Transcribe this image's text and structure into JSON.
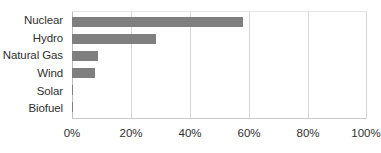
{
  "chart_data": {
    "type": "bar",
    "orientation": "horizontal",
    "title": "",
    "subtitle": "",
    "xlabel": "",
    "ylabel": "",
    "categories": [
      "Nuclear",
      "Hydro",
      "Natural Gas",
      "Wind",
      "Solar",
      "Biofuel"
    ],
    "values": [
      58,
      28.5,
      9,
      7.8,
      0.5,
      0.4
    ],
    "xlim": [
      0,
      100
    ],
    "x_tick_values": [
      0,
      20,
      40,
      60,
      80,
      100
    ],
    "x_tick_labels": [
      "0%",
      "20%",
      "40%",
      "60%",
      "80%",
      "100%"
    ],
    "grid": "vertical",
    "legend": "none",
    "series": [
      {
        "name": "",
        "color": "#7f7f7f",
        "values": [
          58,
          28.5,
          9,
          7.8,
          0.5,
          0.4
        ]
      }
    ]
  },
  "style": {
    "bar_color": "#7f7f7f",
    "gridline_color": "#d8d8d8",
    "axis_color": "#bdbdbd",
    "text_color": "#2f2f2f",
    "background": "#ffffff"
  }
}
